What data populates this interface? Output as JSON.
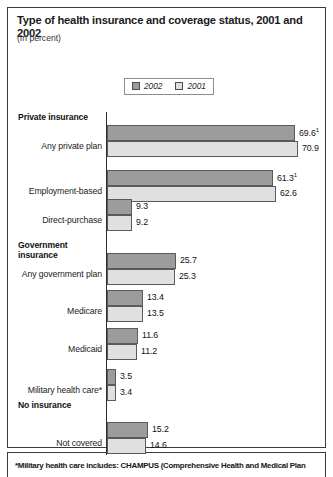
{
  "header": {
    "title": "Type of health insurance and coverage status, 2001 and 2002",
    "subtitle": "(In percent)"
  },
  "legend": {
    "items": [
      {
        "label": "2002",
        "color": "#9c9c9c",
        "key": "y2002"
      },
      {
        "label": "2001",
        "color": "#e0e0e0",
        "key": "y2001"
      }
    ]
  },
  "footnote": "*Military health care includes: CHAMPUS (Comprehensive Health and Medical Plan",
  "groups": [
    {
      "header": "Private insurance"
    },
    {
      "header": "Government insurance"
    },
    {
      "header": "No insurance"
    }
  ],
  "rows": [
    {
      "label": "Any private plan",
      "v2002": "69.6",
      "v2001": "70.9",
      "note2002": "1"
    },
    {
      "label": "Employment-based",
      "v2002": "61.3",
      "v2001": "62.6",
      "note2002": "1"
    },
    {
      "label": "Direct-purchase",
      "v2002": "9.3",
      "v2001": "9.2",
      "note2002": ""
    },
    {
      "label": "Any government plan",
      "v2002": "25.7",
      "v2001": "25.3",
      "note2002": ""
    },
    {
      "label": "Medicare",
      "v2002": "13.4",
      "v2001": "13.5",
      "note2002": ""
    },
    {
      "label": "Medicaid",
      "v2002": "11.6",
      "v2001": "11.2",
      "note2002": ""
    },
    {
      "label": "Military health care*",
      "v2002": "3.5",
      "v2001": "3.4",
      "note2002": ""
    },
    {
      "label": "Not covered",
      "v2002": "15.2",
      "v2001": "14.6",
      "note2002": ""
    }
  ],
  "chart_data": {
    "type": "bar",
    "orientation": "horizontal",
    "title": "Type of health insurance and coverage status, 2001 and 2002",
    "subtitle": "(In percent)",
    "xlabel": "",
    "ylabel": "",
    "xlim": [
      0,
      80
    ],
    "grid": false,
    "legend_position": "top-center",
    "categories": [
      "Any private plan",
      "Employment-based",
      "Direct-purchase",
      "Any government plan",
      "Medicare",
      "Medicaid",
      "Military health care*",
      "Not covered"
    ],
    "category_groups": {
      "Private insurance": [
        "Any private plan",
        "Employment-based",
        "Direct-purchase"
      ],
      "Government insurance": [
        "Any government plan",
        "Medicare",
        "Medicaid",
        "Military health care*"
      ],
      "No insurance": [
        "Not covered"
      ]
    },
    "series": [
      {
        "name": "2002",
        "color": "#9c9c9c",
        "values": [
          69.6,
          61.3,
          9.3,
          25.7,
          13.4,
          11.6,
          3.5,
          15.2
        ]
      },
      {
        "name": "2001",
        "color": "#e0e0e0",
        "values": [
          70.9,
          62.6,
          9.2,
          25.3,
          13.5,
          11.2,
          3.4,
          14.6
        ]
      }
    ],
    "annotations": [
      "69.6 (2002, Any private plan) carries footnote marker 1",
      "61.3 (2002, Employment-based) carries footnote marker 1"
    ],
    "footnote": "*Military health care includes: CHAMPUS (Comprehensive Health and Medical Plan"
  },
  "layout": {
    "axis_x_px": 107,
    "px_per_unit": 2.7,
    "group_header_tops": [
      112,
      240,
      400
    ],
    "row_tops": [
      123,
      169,
      200,
      251,
      288,
      326,
      367,
      420
    ]
  }
}
